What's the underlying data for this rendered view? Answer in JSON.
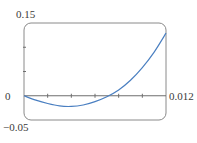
{
  "chart_data": {
    "type": "line",
    "title": "",
    "xlabel": "",
    "ylabel": "",
    "xlim": [
      0,
      0.012
    ],
    "ylim": [
      -0.05,
      0.15
    ],
    "x_tick_labels": [
      "0.012"
    ],
    "y_tick_labels": [
      "0.15",
      "0",
      "−0.05"
    ],
    "x_ticks": [
      0,
      0.002,
      0.004,
      0.006,
      0.008,
      0.01,
      0.012
    ],
    "y_ticks": [
      -0.05,
      0,
      0.05,
      0.1,
      0.15
    ],
    "grid": false,
    "legend": null,
    "series": [
      {
        "name": "f(x)",
        "color": "#4a7fc1",
        "x": [
          0,
          0.001,
          0.002,
          0.003,
          0.004,
          0.005,
          0.006,
          0.007,
          0.008,
          0.009,
          0.01,
          0.011,
          0.012
        ],
        "y": [
          0,
          -0.009,
          -0.016,
          -0.021,
          -0.022,
          -0.019,
          -0.012,
          -0.002,
          0.012,
          0.032,
          0.058,
          0.09,
          0.129
        ]
      }
    ]
  },
  "labels": {
    "y_top": "0.15",
    "y_zero": "0",
    "y_bottom": "−0.05",
    "x_right": "0.012"
  },
  "colors": {
    "frame": "#8a8a8a",
    "axis": "#6e6e6e",
    "curve": "#4a7fc1"
  }
}
